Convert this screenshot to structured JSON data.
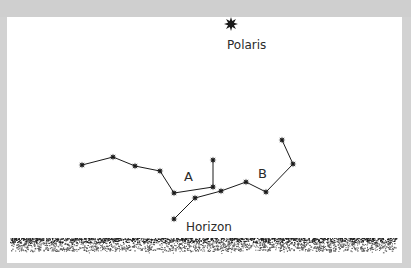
{
  "diagram": {
    "title_star": {
      "label": "Polaris",
      "x": 231,
      "y": 24
    },
    "constellation_labels": [
      {
        "id": "A",
        "label": "A",
        "x": 189,
        "y": 181
      },
      {
        "id": "B",
        "label": "B",
        "x": 264,
        "y": 178
      }
    ],
    "horizon": {
      "label": "Horizon",
      "label_x": 186,
      "label_y": 231,
      "band_y": 238,
      "band_h": 13
    },
    "constellation_a": {
      "stars": [
        [
          82,
          165
        ],
        [
          113,
          157
        ],
        [
          135,
          166
        ],
        [
          160,
          171
        ],
        [
          174,
          193
        ],
        [
          213,
          187
        ],
        [
          213,
          160
        ]
      ],
      "edges": [
        [
          0,
          1
        ],
        [
          1,
          2
        ],
        [
          2,
          3
        ],
        [
          3,
          4
        ],
        [
          4,
          5
        ],
        [
          5,
          6
        ]
      ]
    },
    "constellation_b": {
      "stars": [
        [
          174,
          219
        ],
        [
          195,
          198
        ],
        [
          221,
          191
        ],
        [
          246,
          182
        ],
        [
          266,
          192
        ],
        [
          293,
          164
        ],
        [
          282,
          140
        ]
      ],
      "edges": [
        [
          0,
          1
        ],
        [
          1,
          2
        ],
        [
          2,
          3
        ],
        [
          3,
          4
        ],
        [
          4,
          5
        ],
        [
          5,
          6
        ]
      ]
    },
    "colors": {
      "ink": "#1a1a1a",
      "paper": "#ffffff",
      "frame": "#d2d2d2"
    }
  }
}
